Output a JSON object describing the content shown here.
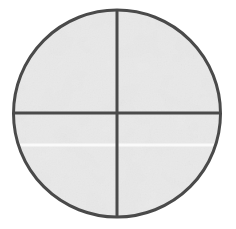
{
  "canvas": {
    "width": 236,
    "height": 229,
    "background_color": "#ffffff",
    "label": "Scanned reticle diagram"
  },
  "figure": {
    "name": "crosshair-circle",
    "circle": {
      "center_x": 117,
      "center_y": 113.5,
      "radius": 103.5,
      "stroke_color": "#4a4a4a",
      "stroke_width": 3,
      "fill_color": "#f0f0f0"
    },
    "vertical_line": {
      "x": 117,
      "y_start": 10,
      "y_end": 217,
      "stroke_color": "#4a4a4a",
      "stroke_width": 3
    },
    "horizontal_line": {
      "y": 113,
      "x_start": 13.5,
      "x_end": 220.5,
      "stroke_color": "#4a4a4a",
      "stroke_width": 3
    },
    "quadrants": [
      {
        "name": "top-left"
      },
      {
        "name": "top-right"
      },
      {
        "name": "bottom-left"
      },
      {
        "name": "bottom-right"
      }
    ],
    "artifacts": {
      "scan_seam_y": 145,
      "scan_seam_color": "#fdfdfd",
      "paper_texture_color": "#e8e8e8",
      "showthrough_color": "#e6e6e6"
    }
  }
}
